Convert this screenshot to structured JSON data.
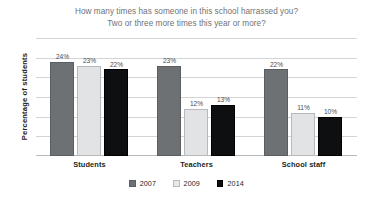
{
  "chart_data": {
    "type": "bar",
    "title": "How many times has someone in this school harrassed you? Two or three more times this year or more?",
    "title_lines": [
      "How many times has someone in this school harrassed you?",
      "Two or three more times this year or more?"
    ],
    "xlabel": "",
    "ylabel": "Percentage of students",
    "categories": [
      "Students",
      "Teachers",
      "School staff"
    ],
    "series": [
      {
        "name": "2007",
        "color": "#6e7174",
        "values": [
          24,
          23,
          22
        ],
        "labels": [
          "24%",
          "23%",
          "22%"
        ]
      },
      {
        "name": "2009",
        "color": "#e2e3e4",
        "values": [
          23,
          12,
          11
        ],
        "labels": [
          "23%",
          "12%",
          "11%"
        ]
      },
      {
        "name": "2014",
        "color": "#0d0f11",
        "values": [
          22,
          13,
          10
        ],
        "labels": [
          "22%",
          "13%",
          "10%"
        ]
      }
    ],
    "ylim": [
      0,
      30
    ],
    "y_tick_values": [
      0,
      5,
      10,
      15,
      20,
      25,
      30
    ],
    "y_tick_labels_shown": false,
    "grid": true,
    "legend_position": "bottom-center",
    "value_labels": true,
    "value_label_suffix": "%"
  },
  "legend": {
    "items": [
      {
        "label": "2007",
        "swatch": "series-0-swatch"
      },
      {
        "label": "2009",
        "swatch": "series-1-swatch"
      },
      {
        "label": "2014",
        "swatch": "series-2-swatch"
      }
    ]
  },
  "colors": {
    "background": "#ffffff",
    "title_text": "#6f7276",
    "axis_text": "#1d1f21",
    "gridline": "#d2d4d6",
    "series_2007": "#6e7174",
    "series_2009": "#e2e3e4",
    "series_2014": "#0d0f11"
  }
}
